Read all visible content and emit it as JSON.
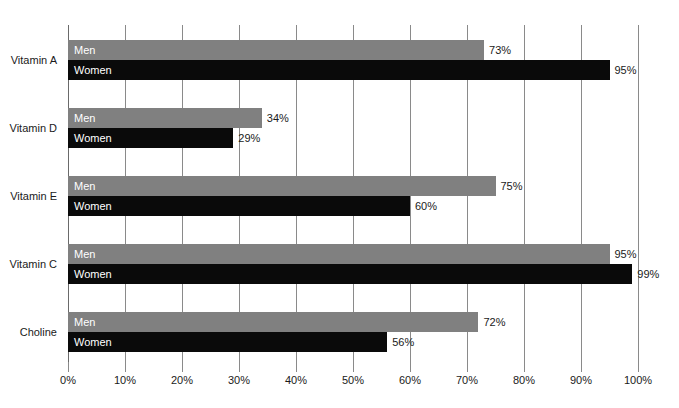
{
  "chart_data": {
    "type": "bar",
    "orientation": "horizontal",
    "title": "",
    "subtitle": "",
    "xlabel": "",
    "ylabel": "",
    "xlim": [
      0,
      100
    ],
    "xtick_labels": [
      "0%",
      "10%",
      "20%",
      "30%",
      "40%",
      "50%",
      "60%",
      "70%",
      "80%",
      "90%",
      "100%"
    ],
    "xticks": [
      0,
      10,
      20,
      30,
      40,
      50,
      60,
      70,
      80,
      90,
      100
    ],
    "grid": true,
    "grid_axis": "x",
    "legend": "inline-bar-labels",
    "categories": [
      "Vitamin A",
      "Vitamin D",
      "Vitamin E",
      "Vitamin C",
      "Choline"
    ],
    "series": [
      {
        "name": "Men",
        "color": "#808080",
        "values": [
          73,
          34,
          75,
          95,
          72
        ],
        "value_labels": [
          "73%",
          "34%",
          "75%",
          "95%",
          "72%"
        ]
      },
      {
        "name": "Women",
        "color": "#0a0a0a",
        "values": [
          95,
          29,
          60,
          99,
          56
        ],
        "value_labels": [
          "95%",
          "29%",
          "60%",
          "99%",
          "56%"
        ]
      }
    ]
  },
  "colors": {
    "men_bar": "#808080",
    "women_bar": "#0a0a0a",
    "gridline": "#8a8a8a",
    "text": "#1a1a1a",
    "bar_label_text": "#ffffff",
    "background": "#ffffff"
  }
}
